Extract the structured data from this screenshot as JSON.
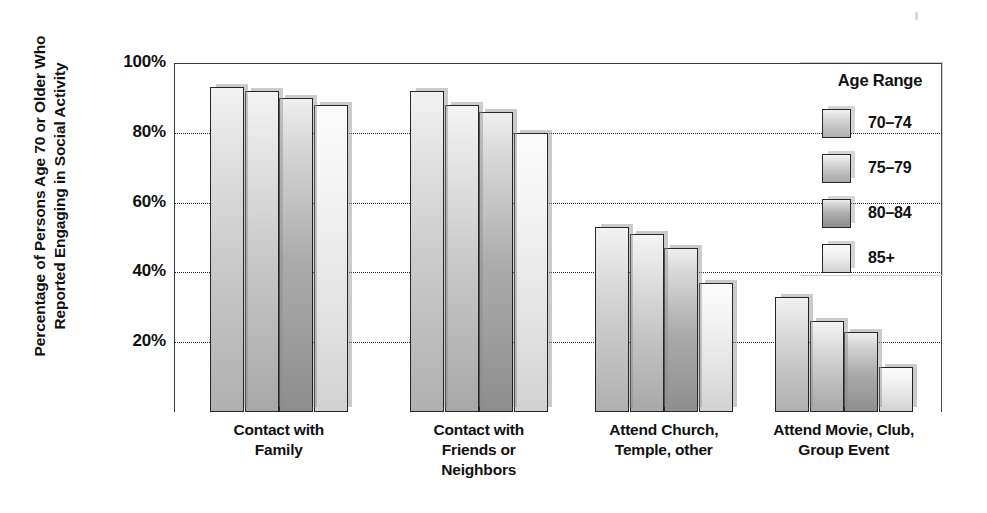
{
  "chart_data": {
    "type": "bar",
    "title": "",
    "xlabel": "",
    "ylabel": "Percentage of Persons Age 70 or Older Who Reported Engaging in Social Activity",
    "ylabel_lines": [
      "Percentage of Persons Age 70 or Older Who",
      "Reported Engaging in Social Activity"
    ],
    "ylim": [
      0,
      100
    ],
    "ytick_labels": [
      "100%",
      "80%",
      "60%",
      "40%",
      "20%"
    ],
    "ytick_values": [
      100,
      80,
      60,
      40,
      20
    ],
    "gridlines": [
      80,
      60,
      40,
      20
    ],
    "grid": true,
    "legend_position": "top-right",
    "legend_title": "Age Range",
    "categories": [
      "Contact with Family",
      "Contact with Friends or Neighbors",
      "Attend Church, Temple, other",
      "Attend Movie, Club, Group Event"
    ],
    "category_label_lines": [
      [
        "Contact with",
        "Family"
      ],
      [
        "Contact with",
        "Friends or",
        "Neighbors"
      ],
      [
        "Attend Church,",
        "Temple, other"
      ],
      [
        "Attend Movie, Club,",
        "Group Event"
      ]
    ],
    "series": [
      {
        "name": "70–74",
        "values": [
          93,
          92,
          53,
          33
        ]
      },
      {
        "name": "75–79",
        "values": [
          92,
          88,
          51,
          26
        ]
      },
      {
        "name": "80–84",
        "values": [
          90,
          86,
          47,
          23
        ]
      },
      {
        "name": "85+",
        "values": [
          88,
          80,
          37,
          13
        ]
      }
    ],
    "series_colors": [
      "#c9c9c9",
      "#c6c6c6",
      "#ababab",
      "#e4e4e4"
    ]
  },
  "legend": {
    "title": "Age Range",
    "items": [
      {
        "label": "70–74"
      },
      {
        "label": "75–79"
      },
      {
        "label": "80–84"
      },
      {
        "label": "85+"
      }
    ]
  },
  "axis": {
    "y_title_line1": "Percentage of Persons Age 70 or Older Who",
    "y_title_line2": "Reported Engaging in Social Activity",
    "ticks": [
      "100%",
      "80%",
      "60%",
      "40%",
      "20%"
    ]
  }
}
